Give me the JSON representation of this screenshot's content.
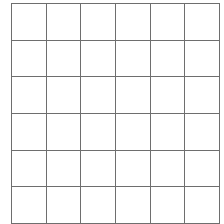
{
  "page": {
    "background_color": "#ffffff",
    "width": 224,
    "height": 224
  },
  "grid": {
    "name": "blank-square-grid",
    "rows": 6,
    "columns": 6,
    "cell_count": 36,
    "line_color": "#6e6e6e",
    "line_width_px": 1.4,
    "cell_fill_color": "#ffffff",
    "geometry": {
      "left_px": 11,
      "top_px": 3,
      "width_px": 202,
      "height_px": 214,
      "cell_width_px": 33.7,
      "cell_height_px": 35.7
    },
    "cells": [
      [
        "",
        "",
        "",
        "",
        "",
        ""
      ],
      [
        "",
        "",
        "",
        "",
        "",
        ""
      ],
      [
        "",
        "",
        "",
        "",
        "",
        ""
      ],
      [
        "",
        "",
        "",
        "",
        "",
        ""
      ],
      [
        "",
        "",
        "",
        "",
        "",
        ""
      ],
      [
        "",
        "",
        "",
        "",
        "",
        ""
      ]
    ]
  }
}
